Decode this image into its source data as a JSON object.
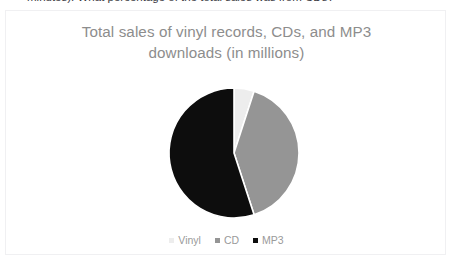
{
  "page": {
    "clipped_question": "minutes). What percentage of the total sales was from CDs?"
  },
  "chart_panel": {
    "title_line_1": "Total sales of vinyl records, CDs, and MP3",
    "title_line_2": "downloads (in millions)",
    "title_color": "#8d8d8d",
    "background_color": "#ffffff",
    "border_color": "#f0f0f2"
  },
  "legend": {
    "position": "bottom-center",
    "items": [
      {
        "label": "Vinyl",
        "color": "#ededed"
      },
      {
        "label": "CD",
        "color": "#959595"
      },
      {
        "label": "MP3",
        "color": "#0d0d0d"
      }
    ]
  },
  "chart_data": {
    "type": "pie",
    "title": "Total sales of vinyl records, CDs, and MP3 downloads (in millions)",
    "xlabel": "",
    "ylabel": "",
    "categories": [
      "Vinyl",
      "CD",
      "MP3"
    ],
    "values": [
      5,
      40,
      55
    ],
    "unit": "percent",
    "colors": [
      "#ededed",
      "#959595",
      "#0d0d0d"
    ],
    "start_angle_deg": 0,
    "direction": "clockwise",
    "legend_position": "bottom",
    "grid": false,
    "data_labels_shown": false,
    "slice_separator_color": "#ffffff",
    "center_px": [
      228,
      148
    ],
    "radius_px": 65
  }
}
